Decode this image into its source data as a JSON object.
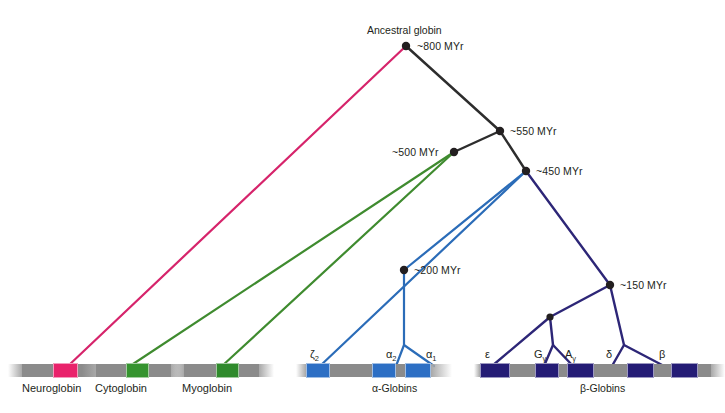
{
  "figure": {
    "caption": ""
  },
  "colors": {
    "black_branch": "#2d2d2d",
    "pink_branch": "#d6246b",
    "green_branch": "#3f8b2f",
    "blue_branch": "#2b6cb8",
    "navy_branch": "#2d2677",
    "node_dot": "#231f20",
    "chrom_grey": "#8b8b8b",
    "chrom_grey_light": "#a8a8a8",
    "neuroglobin_gene": "#e9226b",
    "cytoglobin_gene": "#35942f",
    "myoglobin_gene": "#2f8a2c",
    "alpha_gene": "#2d6fc4",
    "beta_gene": "#241c75",
    "text": "#231f20"
  },
  "root": {
    "label": "Ancestral globin",
    "age": "~800 MYr"
  },
  "nodes": [
    {
      "id": "root",
      "age": "~800 MYr",
      "x": 406,
      "y": 46,
      "label_x": 417,
      "label_y": 41
    },
    {
      "id": "n550",
      "age": "~550 MYr",
      "x": 500,
      "y": 131,
      "label_x": 510,
      "label_y": 126
    },
    {
      "id": "n500",
      "age": "~500 MYr",
      "x": 454,
      "y": 152,
      "label_x": 392,
      "label_y": 147
    },
    {
      "id": "n450",
      "age": "~450 MYr",
      "x": 526,
      "y": 171,
      "label_x": 536,
      "label_y": 166
    },
    {
      "id": "n200",
      "age": "~200 MYr",
      "x": 404,
      "y": 270,
      "label_x": 414,
      "label_y": 265
    },
    {
      "id": "n150",
      "age": "~150 MYr",
      "x": 610,
      "y": 285,
      "label_x": 620,
      "label_y": 280
    },
    {
      "id": "nGA",
      "age": "",
      "x": 550,
      "y": 317,
      "label_x": 0,
      "label_y": 0
    }
  ],
  "branches": [
    {
      "name": "root-to-neuroglobin",
      "color_key": "pink_branch",
      "width": 2.2,
      "points": "406,46 68,366"
    },
    {
      "name": "root-to-n550",
      "color_key": "black_branch",
      "width": 2.4,
      "points": "406,46 500,131"
    },
    {
      "name": "n550-to-n500",
      "color_key": "black_branch",
      "width": 2.4,
      "points": "500,131 454,152"
    },
    {
      "name": "n550-to-n450",
      "color_key": "black_branch",
      "width": 2.4,
      "points": "500,131 526,171"
    },
    {
      "name": "n500-to-cytoglobin",
      "color_key": "green_branch",
      "width": 2.2,
      "points": "454,152 130,366"
    },
    {
      "name": "n500-to-myoglobin",
      "color_key": "green_branch",
      "width": 2.2,
      "points": "454,152 222,366"
    },
    {
      "name": "n450-to-zeta2",
      "color_key": "blue_branch",
      "width": 2.2,
      "points": "526,171 320,366"
    },
    {
      "name": "n450-to-n200",
      "color_key": "blue_branch",
      "width": 2.2,
      "points": "526,171 404,270"
    },
    {
      "name": "n200-to-alpha2",
      "color_key": "blue_branch",
      "width": 2.2,
      "points": "404,270 404,345 396,366"
    },
    {
      "name": "n200-to-alpha1",
      "color_key": "blue_branch",
      "width": 2.2,
      "points": "404,345 434,366"
    },
    {
      "name": "n450-to-n150",
      "color_key": "navy_branch",
      "width": 2.4,
      "points": "526,171 610,285"
    },
    {
      "name": "n150-to-nGA",
      "color_key": "navy_branch",
      "width": 2.4,
      "points": "610,285 550,317"
    },
    {
      "name": "nGA-to-epsilon",
      "color_key": "navy_branch",
      "width": 2.4,
      "points": "550,317 492,366"
    },
    {
      "name": "nGA-to-Ggamma",
      "color_key": "navy_branch",
      "width": 2.4,
      "points": "550,317 553,345 544,366"
    },
    {
      "name": "nGA-to-Agamma",
      "color_key": "navy_branch",
      "width": 2.4,
      "points": "553,345 573,366"
    },
    {
      "name": "n150-to-delta",
      "color_key": "navy_branch",
      "width": 2.4,
      "points": "610,285 624,345 612,366"
    },
    {
      "name": "n150-to-beta",
      "color_key": "navy_branch",
      "width": 2.4,
      "points": "624,345 664,366"
    }
  ],
  "tracks": [
    {
      "name": "Neuroglobin",
      "label": "Neuroglobin",
      "label_x": 22,
      "label_y": 383,
      "x": 8,
      "y": 364,
      "width": 112,
      "segments": [
        {
          "kind": "grey",
          "w": 14,
          "color_key": "chrom_grey_light",
          "fade": "left"
        },
        {
          "kind": "grey",
          "w": 31,
          "color_key": "chrom_grey"
        },
        {
          "kind": "gene",
          "w": 25,
          "color_key": "neuroglobin_gene",
          "gene": "NGB"
        },
        {
          "kind": "grey",
          "w": 26,
          "color_key": "chrom_grey"
        },
        {
          "kind": "grey",
          "w": 16,
          "color_key": "chrom_grey_light",
          "fade": "right"
        }
      ]
    },
    {
      "name": "Cytoglobin",
      "label": "Cytoglobin",
      "label_x": 95,
      "label_y": 383,
      "x": 82,
      "y": 364,
      "width": 104,
      "segments": [
        {
          "kind": "grey",
          "w": 14,
          "color_key": "chrom_grey_light",
          "fade": "left"
        },
        {
          "kind": "grey",
          "w": 30,
          "color_key": "chrom_grey"
        },
        {
          "kind": "gene",
          "w": 23,
          "color_key": "cytoglobin_gene",
          "gene": "CYGB"
        },
        {
          "kind": "grey",
          "w": 22,
          "color_key": "chrom_grey"
        },
        {
          "kind": "grey",
          "w": 15,
          "color_key": "chrom_grey_light",
          "fade": "right"
        }
      ]
    },
    {
      "name": "Myoglobin",
      "label": "Myoglobin",
      "label_x": 182,
      "label_y": 383,
      "x": 170,
      "y": 364,
      "width": 104,
      "segments": [
        {
          "kind": "grey",
          "w": 14,
          "color_key": "chrom_grey_light",
          "fade": "left"
        },
        {
          "kind": "grey",
          "w": 32,
          "color_key": "chrom_grey"
        },
        {
          "kind": "gene",
          "w": 23,
          "color_key": "myoglobin_gene",
          "gene": "MB"
        },
        {
          "kind": "grey",
          "w": 20,
          "color_key": "chrom_grey"
        },
        {
          "kind": "grey",
          "w": 15,
          "color_key": "chrom_grey_light",
          "fade": "right"
        }
      ]
    },
    {
      "name": "alpha-globins",
      "label": "α-Globins",
      "label_x": 372,
      "label_y": 383,
      "x": 296,
      "y": 364,
      "width": 156,
      "segments": [
        {
          "kind": "grey",
          "w": 10,
          "color_key": "chrom_grey_light",
          "fade": "left"
        },
        {
          "kind": "gene",
          "w": 24,
          "color_key": "alpha_gene",
          "gene": "zeta2"
        },
        {
          "kind": "grey",
          "w": 42,
          "color_key": "chrom_grey"
        },
        {
          "kind": "gene",
          "w": 24,
          "color_key": "alpha_gene",
          "gene": "alpha2"
        },
        {
          "kind": "grey",
          "w": 9,
          "color_key": "chrom_grey"
        },
        {
          "kind": "gene",
          "w": 26,
          "color_key": "alpha_gene",
          "gene": "alpha1"
        },
        {
          "kind": "grey",
          "w": 21,
          "color_key": "chrom_grey_light",
          "fade": "right"
        }
      ]
    },
    {
      "name": "beta-globins",
      "label": "β-Globins",
      "label_x": 580,
      "label_y": 383,
      "x": 474,
      "y": 364,
      "width": 231,
      "segments": [
        {
          "kind": "grey",
          "w": 6,
          "color_key": "chrom_grey_light",
          "fade": "left"
        },
        {
          "kind": "gene",
          "w": 30,
          "color_key": "beta_gene",
          "gene": "epsilon"
        },
        {
          "kind": "grey",
          "w": 25,
          "color_key": "chrom_grey"
        },
        {
          "kind": "gene",
          "w": 24,
          "color_key": "beta_gene",
          "gene": "Ggamma"
        },
        {
          "kind": "grey",
          "w": 8,
          "color_key": "chrom_grey"
        },
        {
          "kind": "gene",
          "w": 27,
          "color_key": "beta_gene",
          "gene": "Agamma"
        },
        {
          "kind": "grey",
          "w": 33,
          "color_key": "chrom_grey"
        },
        {
          "kind": "gene",
          "w": 27,
          "color_key": "beta_gene",
          "gene": "delta"
        },
        {
          "kind": "grey",
          "w": 17,
          "color_key": "chrom_grey"
        },
        {
          "kind": "gene",
          "w": 27,
          "color_key": "beta_gene",
          "gene": "beta"
        },
        {
          "kind": "grey",
          "w": 13,
          "color_key": "chrom_grey"
        },
        {
          "kind": "grey",
          "w": 14,
          "color_key": "chrom_grey_light",
          "fade": "right"
        }
      ]
    }
  ],
  "gene_labels": [
    {
      "name": "zeta2",
      "main": "ζ",
      "sub": "2",
      "x": 310,
      "y": 349
    },
    {
      "name": "alpha2",
      "main": "α",
      "sub": "2",
      "x": 386,
      "y": 349
    },
    {
      "name": "alpha1",
      "main": "α",
      "sub": "1",
      "x": 426,
      "y": 349
    },
    {
      "name": "epsilon",
      "main": "ε",
      "sub": "",
      "x": 485,
      "y": 349
    },
    {
      "name": "Ggamma",
      "main": "G",
      "sub": "γ",
      "x": 534,
      "y": 349
    },
    {
      "name": "Agamma",
      "main": "A",
      "sub": "γ",
      "x": 565,
      "y": 349
    },
    {
      "name": "delta",
      "main": "δ",
      "sub": "",
      "x": 606,
      "y": 349
    },
    {
      "name": "beta",
      "main": "β",
      "sub": "",
      "x": 659,
      "y": 349
    }
  ]
}
